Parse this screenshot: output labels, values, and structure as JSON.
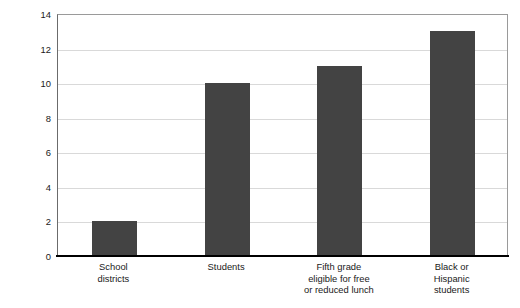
{
  "chart_data": {
    "type": "bar",
    "title": "",
    "xlabel": "",
    "ylabel": "Percent of districts, students served by STARBASE",
    "ylim": [
      0,
      14
    ],
    "ytick_values": [
      0,
      2,
      4,
      6,
      8,
      10,
      12,
      14
    ],
    "ytick_labels": [
      "0",
      "2",
      "4",
      "6",
      "8",
      "10",
      "12",
      "14"
    ],
    "grid": true,
    "legend": false,
    "bar_color": "#434343",
    "gridline_color": "#d9d9d9",
    "axis_color": "#000000",
    "categories": [
      "School districts",
      "Students",
      "Fifth grade eligible for free or reduced lunch",
      "Black or Hispanic students"
    ],
    "category_lines": [
      [
        "School",
        "districts"
      ],
      [
        "Students"
      ],
      [
        "Fifth grade",
        "eligible for free",
        "or reduced lunch"
      ],
      [
        "Black or",
        "Hispanic",
        "students"
      ]
    ],
    "values": [
      2,
      10,
      11,
      13
    ]
  }
}
